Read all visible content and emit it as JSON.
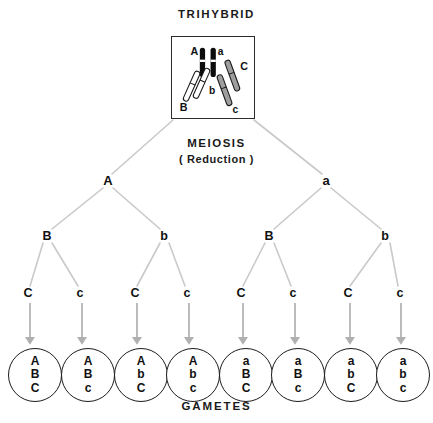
{
  "figure": {
    "title": "TRIHYBRID",
    "footer": "GAMETES",
    "process_label": "MEIOSIS",
    "process_sub": "( Reduction )"
  },
  "colors": {
    "line": "#c9c9c9",
    "arrow": "#b0b0b0",
    "text": "#111111",
    "box_border": "#2b2b2b",
    "chromosome_a_fill": "#0d0d0d",
    "chromosome_b_fill": "#ffffff",
    "chromosome_c_fill": "#9e9e9e",
    "chromosome_outline": "#1a1a1a",
    "background": "#ffffff"
  },
  "parent_cell": {
    "label": "TRIHYBRID",
    "chromosome_labels": [
      "A",
      "a",
      "B",
      "b",
      "C",
      "c"
    ],
    "pairs": [
      {
        "alleles": [
          "A",
          "a"
        ],
        "style": "black"
      },
      {
        "alleles": [
          "B",
          "b"
        ],
        "style": "white"
      },
      {
        "alleles": [
          "C",
          "c"
        ],
        "style": "gray"
      }
    ]
  },
  "tree": {
    "tier1": [
      {
        "label": "A",
        "x": 108,
        "y": 181
      },
      {
        "label": "a",
        "x": 326,
        "y": 181
      }
    ],
    "tier2": [
      {
        "label": "B",
        "x": 47,
        "y": 236
      },
      {
        "label": "b",
        "x": 164,
        "y": 236
      },
      {
        "label": "B",
        "x": 269,
        "y": 236
      },
      {
        "label": "b",
        "x": 385,
        "y": 236
      }
    ],
    "tier3": [
      {
        "label": "C",
        "x": 28,
        "y": 293
      },
      {
        "label": "c",
        "x": 80,
        "y": 293
      },
      {
        "label": "C",
        "x": 135,
        "y": 293
      },
      {
        "label": "c",
        "x": 187,
        "y": 293
      },
      {
        "label": "C",
        "x": 241,
        "y": 293
      },
      {
        "label": "c",
        "x": 293,
        "y": 293
      },
      {
        "label": "C",
        "x": 348,
        "y": 293
      },
      {
        "label": "c",
        "x": 400,
        "y": 293
      }
    ]
  },
  "gametes": [
    {
      "alleles": [
        "A",
        "B",
        "C"
      ],
      "x": 35
    },
    {
      "alleles": [
        "A",
        "B",
        "c"
      ],
      "x": 88
    },
    {
      "alleles": [
        "A",
        "b",
        "C"
      ],
      "x": 141
    },
    {
      "alleles": [
        "A",
        "b",
        "c"
      ],
      "x": 193
    },
    {
      "alleles": [
        "a",
        "B",
        "C"
      ],
      "x": 246
    },
    {
      "alleles": [
        "a",
        "B",
        "c"
      ],
      "x": 298
    },
    {
      "alleles": [
        "a",
        "b",
        "C"
      ],
      "x": 351
    },
    {
      "alleles": [
        "a",
        "b",
        "c"
      ],
      "x": 403
    }
  ]
}
